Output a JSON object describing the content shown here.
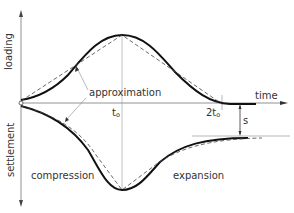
{
  "diagram": {
    "axes": {
      "x_label": "time",
      "y_up_label": "loading",
      "y_down_label": "settlement"
    },
    "labels": {
      "approximation": "approximation",
      "t0_main": "t",
      "t0_sub": "o",
      "two_t0_main": "2t",
      "two_t0_sub": "o",
      "s": "s",
      "compression": "compression",
      "expansion": "expansion"
    },
    "colors": {
      "curve": "#111111",
      "dashed": "#444444",
      "axis": "#666666",
      "thin": "#999999"
    }
  }
}
